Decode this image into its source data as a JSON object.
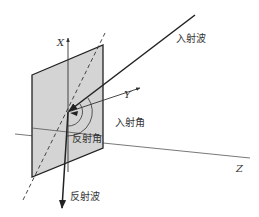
{
  "diagram": {
    "type": "3d-reflection-geometry",
    "colors": {
      "plane_fill": "#d4d4d4",
      "plane_stroke": "#222222",
      "line": "#222222",
      "thin_line": "#555555",
      "text": "#333333"
    },
    "axes": {
      "x_label": "X",
      "y_label": "Y",
      "z_label": "Z"
    },
    "labels": {
      "incident_wave": "入射波",
      "reflected_wave": "反射波",
      "incident_angle": "入射角",
      "reflection_angle": "反射角"
    }
  }
}
